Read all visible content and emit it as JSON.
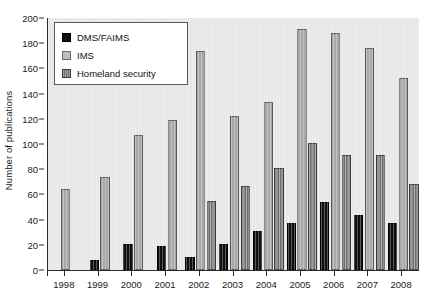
{
  "chart_data": {
    "type": "bar",
    "title": "",
    "xlabel": "",
    "ylabel": "Number of publications",
    "ylim": [
      0,
      200
    ],
    "ytick_step": 20,
    "yticks": [
      0,
      20,
      40,
      60,
      80,
      100,
      120,
      140,
      160,
      180,
      200
    ],
    "grid": false,
    "legend_position": "top-left",
    "categories": [
      "1998",
      "1999",
      "2000",
      "2001",
      "2002",
      "2003",
      "2004",
      "2005",
      "2006",
      "2007",
      "2008"
    ],
    "series": [
      {
        "name": "DMS/FAIMS",
        "color": "#101010",
        "values": [
          0,
          8,
          21,
          19,
          10,
          21,
          31,
          37,
          54,
          44,
          37
        ]
      },
      {
        "name": "IMS",
        "color": "#a8a8a8",
        "values": [
          64,
          74,
          107,
          119,
          174,
          122,
          133,
          191,
          188,
          176,
          152
        ]
      },
      {
        "name": "Homeland security",
        "color": "#6f6f6f",
        "values": [
          0,
          0,
          0,
          0,
          55,
          67,
          81,
          101,
          91,
          91,
          68
        ]
      }
    ]
  },
  "legend": {
    "items": [
      {
        "label": "DMS/FAIMS"
      },
      {
        "label": "IMS"
      },
      {
        "label": "Homeland security"
      }
    ]
  }
}
